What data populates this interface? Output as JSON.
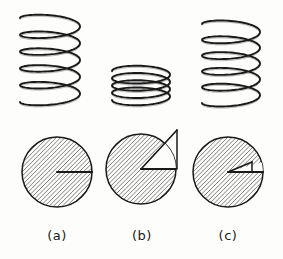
{
  "figure": {
    "type": "technical-line-drawing",
    "background_color": "#fdfdfc",
    "ink_color": "#1a1a1a",
    "hatch_color": "#3a3a3a",
    "width": 283,
    "height": 259,
    "panels": [
      {
        "id": "a",
        "label": "(a)",
        "label_x": 57,
        "label_y": 228,
        "spring": {
          "name": "spring-free-length",
          "state": "extended",
          "cx": 50,
          "top": 18,
          "bottom": 102,
          "half_width": 30,
          "coils": 5,
          "perspective_drop": 7
        },
        "circle": {
          "name": "end-coil-gap-closed",
          "cx": 57,
          "cy": 172,
          "r": 35,
          "gap_angle_deg": 0,
          "hatched": true,
          "hatch_angle_deg": 45,
          "radius_line": "horizontal-right",
          "apex_outside": false
        }
      },
      {
        "id": "b",
        "label": "(b)",
        "label_x": 142,
        "label_y": 228,
        "spring": {
          "name": "spring-compressed-solid",
          "state": "compressed",
          "cx": 141,
          "top": 71,
          "bottom": 100,
          "half_width": 29,
          "coils": 4,
          "perspective_drop": 7
        },
        "circle": {
          "name": "end-coil-gap-wide",
          "cx": 141,
          "cy": 169,
          "r": 35,
          "gap_angle_deg": 47,
          "hatched": true,
          "hatch_angle_deg": 45,
          "radius_line": "horizontal-right",
          "apex_outside": true,
          "apex_x": 177,
          "apex_y": 130
        }
      },
      {
        "id": "c",
        "label": "(c)",
        "label_x": 228,
        "label_y": 228,
        "spring": {
          "name": "spring-partially-compressed",
          "state": "extended",
          "cx": 231,
          "top": 24,
          "bottom": 103,
          "half_width": 29,
          "coils": 5,
          "perspective_drop": 7
        },
        "circle": {
          "name": "end-coil-gap-narrow",
          "cx": 228,
          "cy": 172,
          "r": 35,
          "gap_angle_deg": 16,
          "hatched": true,
          "hatch_angle_deg": 45,
          "radius_line": "horizontal-right",
          "apex_outside": false,
          "apex_x": 252,
          "apex_y": 162
        }
      }
    ]
  }
}
